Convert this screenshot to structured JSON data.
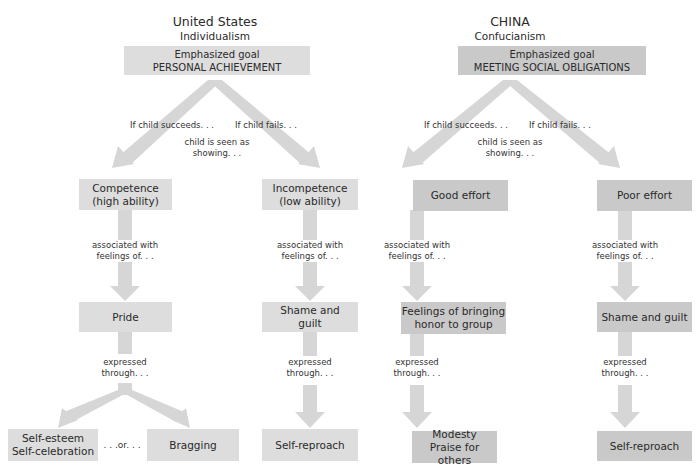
{
  "us": {
    "title": "United States",
    "subtitle": "Individualism",
    "goal_label": "Emphasized goal",
    "goal_value": "PERSONAL ACHIEVEMENT",
    "branch_success": "If child succeeds. . .",
    "branch_fail": "If child fails. . .",
    "seen_as_1": "child is seen as",
    "seen_as_2": "showing. . .",
    "success_box_1": "Competence",
    "success_box_2": "(high ability)",
    "fail_box_1": "Incompetence",
    "fail_box_2": "(low ability)",
    "assoc_1": "associated with",
    "assoc_2": "feelings of. . .",
    "success_feeling": "Pride",
    "fail_feeling_1": "Shame and",
    "fail_feeling_2": "guilt",
    "expr_1": "expressed",
    "expr_2": "through. . .",
    "outcome_a_1": "Self-esteem",
    "outcome_a_2": "Self-celebration",
    "or_label": ". . .or. . .",
    "outcome_b": "Bragging",
    "fail_outcome": "Self-reproach"
  },
  "china": {
    "title": "CHINA",
    "subtitle": "Confucianism",
    "goal_label": "Emphasized goal",
    "goal_value": "MEETING SOCIAL OBLIGATIONS",
    "branch_success": "If child succeeds. . .",
    "branch_fail": "If child fails. . .",
    "seen_as_1": "child is seen as",
    "seen_as_2": "showing. . .",
    "success_box": "Good effort",
    "fail_box": "Poor effort",
    "assoc_1": "associated with",
    "assoc_2": "feelings of. . .",
    "success_feeling_1": "Feelings of bringing",
    "success_feeling_2": "honor to group",
    "fail_feeling": "Shame and guilt",
    "expr_1": "expressed",
    "expr_2": "through. . .",
    "success_outcome_1": "Modesty",
    "success_outcome_2": "Praise for others",
    "fail_outcome": "Self-reproach"
  },
  "colors": {
    "us_box": "#dddddd",
    "china_box": "#c9c9c9",
    "arrow": "#d6d6d6"
  }
}
